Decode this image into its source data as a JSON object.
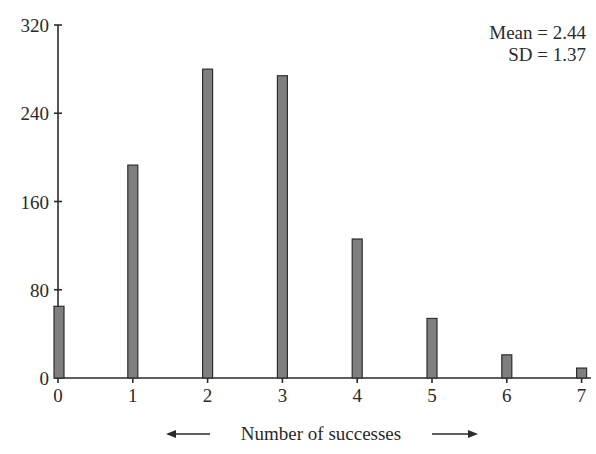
{
  "chart_data": {
    "type": "bar",
    "title": "",
    "xlabel": "Number of successes",
    "ylabel": "",
    "categories": [
      "0",
      "1",
      "2",
      "3",
      "4",
      "5",
      "6",
      "7"
    ],
    "values": [
      65,
      193,
      280,
      274,
      126,
      54,
      21,
      9
    ],
    "ylim": [
      0,
      320
    ],
    "yticks": [
      0,
      80,
      160,
      240,
      320
    ],
    "xticks": [
      0,
      1,
      2,
      3,
      4,
      5,
      6,
      7
    ],
    "grid": false,
    "legend": null,
    "annotations": [
      "Mean = 2.44",
      "SD = 1.37"
    ],
    "xlabel_arrows": true
  },
  "stats": {
    "mean_label": "Mean = 2.44",
    "sd_label": "SD = 1.37"
  },
  "axis": {
    "xlabel": "Number of successes"
  },
  "colors": {
    "bar_fill": "#7f7f7f",
    "bar_stroke": "#2e2e2e",
    "axis": "#2a2a2a"
  }
}
